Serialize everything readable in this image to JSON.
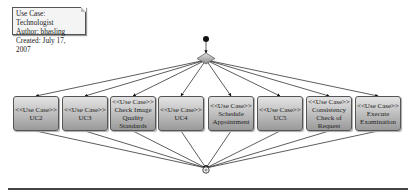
{
  "note": {
    "lines": [
      "Use Case: Technologist",
      "Author: bhasling",
      "Created: July 17, 2007"
    ]
  },
  "stereotype": "<<Use Case>>",
  "use_cases": [
    {
      "name": "UC2",
      "x": 13
    },
    {
      "name": "UC3",
      "x": 62
    },
    {
      "name": "Check Image Quality Standards",
      "x": 110
    },
    {
      "name": "UC4",
      "x": 158
    },
    {
      "name": "Schedule Appointment",
      "x": 208
    },
    {
      "name": "UC5",
      "x": 257
    },
    {
      "name": "Consistency Check of Request",
      "x": 306
    },
    {
      "name": "Execute Examination",
      "x": 355
    }
  ],
  "nodes": {
    "start": {
      "x": 206,
      "y": 39
    },
    "decision": {
      "x": 206,
      "y": 58
    },
    "end": {
      "x": 206,
      "y": 170
    }
  },
  "colors": {
    "line": "#333333",
    "box_top": "#e4e4e4",
    "box_bottom": "#9a9a9a"
  }
}
